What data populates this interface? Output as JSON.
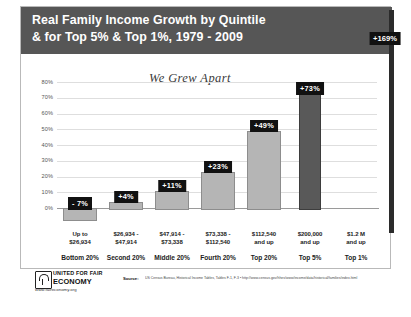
{
  "slide": {
    "title_line1": "Real Family Income Growth by Quintile",
    "title_line2": "& for Top 5% & Top 1%, 1979 - 2009",
    "subtitle": "We Grew Apart",
    "banner_color": "#565656"
  },
  "footer": {
    "logo_line1": "UNITED FOR FAIR",
    "logo_line2": "ECONOMY",
    "logo_url": "www.faireconomy.org",
    "source_label": "Source:",
    "source_text": "US Census Bureau, Historical Income Tables, Tables F-1, F-3  •  http://www.census.gov/hhes/www/income/data/historical/families/index.html"
  },
  "chart_data": {
    "type": "bar",
    "title": "Real Family Income Growth by Quintile & for Top 5% & Top 1%, 1979 - 2009",
    "subtitle": "We Grew Apart",
    "xlabel": "",
    "ylabel": "",
    "ylim": [
      0,
      80
    ],
    "grid": true,
    "legend": "none",
    "ytick_labels": [
      "80%",
      "70%",
      "60%",
      "50%",
      "40%",
      "30%",
      "20%",
      "10%",
      "0%"
    ],
    "ytick_values": [
      80,
      70,
      60,
      50,
      40,
      30,
      20,
      10,
      0
    ],
    "categories": [
      "Bottom 20%",
      "Second 20%",
      "Middle 20%",
      "Fourth 20%",
      "Top 20%",
      "Top 5%",
      "Top 1%"
    ],
    "income_ranges": [
      "Up to\n$26,934",
      "$26,934 -\n$47,914",
      "$47,914 -\n$73,338",
      "$73,338 -\n$112,540",
      "$112,540\nand up",
      "$200,000\nand up",
      "$1.2 M\nand up"
    ],
    "values": [
      -7,
      4,
      11,
      23,
      49,
      73,
      169
    ],
    "data_labels": [
      "- 7%",
      "+4%",
      "+11%",
      "+23%",
      "+49%",
      "+73%",
      "+169%"
    ],
    "bar_colors": [
      "#b5b5b5",
      "#b5b5b5",
      "#b5b5b5",
      "#b5b5b5",
      "#b5b5b5",
      "#595959",
      "#2b2b2b"
    ],
    "bars": [
      {
        "label": "Bottom 20%",
        "range_l1": "Up to",
        "range_l2": "$26,934",
        "value": -7,
        "data_label": "- 7%",
        "style": "light"
      },
      {
        "label": "Second 20%",
        "range_l1": "$26,934 -",
        "range_l2": "$47,914",
        "value": 4,
        "data_label": "+4%",
        "style": "light"
      },
      {
        "label": "Middle 20%",
        "range_l1": "$47,914 -",
        "range_l2": "$73,338",
        "value": 11,
        "data_label": "+11%",
        "style": "light"
      },
      {
        "label": "Fourth 20%",
        "range_l1": "$73,338 -",
        "range_l2": "$112,540",
        "value": 23,
        "data_label": "+23%",
        "style": "light"
      },
      {
        "label": "Top 20%",
        "range_l1": "$112,540",
        "range_l2": "and up",
        "value": 49,
        "data_label": "+49%",
        "style": "light"
      },
      {
        "label": "Top 5%",
        "range_l1": "$200,000",
        "range_l2": "and up",
        "value": 73,
        "data_label": "+73%",
        "style": "dark"
      },
      {
        "label": "Top 1%",
        "range_l1": "$1.2 M",
        "range_l2": "and up",
        "value": 169,
        "data_label": "+169%",
        "style": "black"
      }
    ]
  }
}
